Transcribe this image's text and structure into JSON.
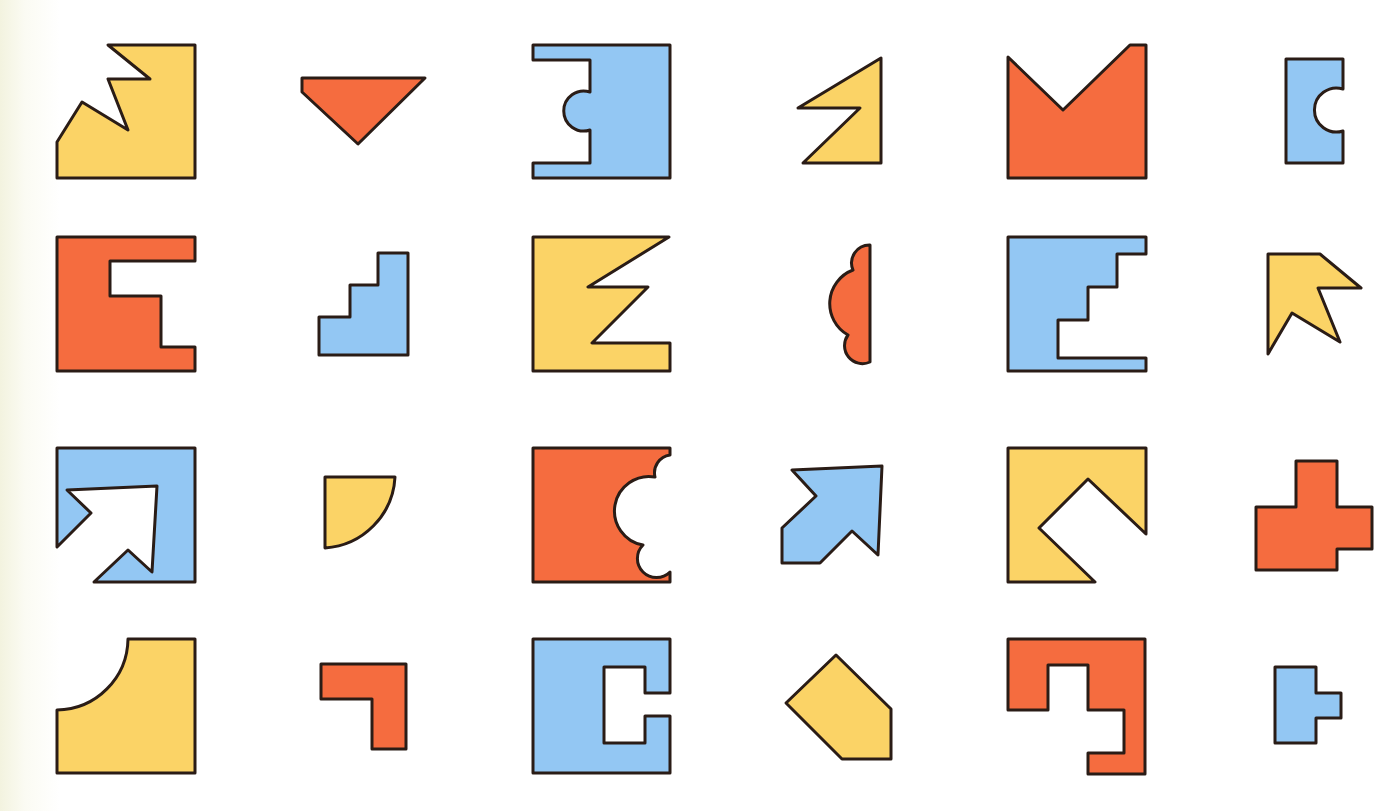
{
  "page": {
    "title": "Shape puzzle grid",
    "background": "#ffffff",
    "edge_tint": "#f3f3df"
  },
  "palette": {
    "yellow": "#fbd366",
    "orange": "#f56c3f",
    "blue": "#93c7f3",
    "outline": "#2a1c16"
  },
  "grid": {
    "rows": 4,
    "columns": 6
  },
  "shapes": [
    {
      "row": 1,
      "col": 1,
      "name": "yellow-zigzag-corner",
      "color": "yellow",
      "d": "M108,45 L195,45 L195,178 L57,178 L57,142 L82,102 L128,130 L108,79 L150,79 Z"
    },
    {
      "row": 1,
      "col": 2,
      "name": "orange-triangle",
      "color": "orange",
      "d": "M302,78 L425,78 L358,144 L302,92 Z"
    },
    {
      "row": 1,
      "col": 3,
      "name": "blue-notched-bump",
      "color": "blue",
      "d": "M533,45 L670,45 L670,178 L533,178 L533,163 L590,163 L590,130 A20,20 0 1 1 590,92 L590,60 L533,60 Z"
    },
    {
      "row": 1,
      "col": 4,
      "name": "yellow-flag",
      "color": "yellow",
      "d": "M881,58 L881,163 L803,163 L860,108 L798,108 Z"
    },
    {
      "row": 1,
      "col": 5,
      "name": "orange-v-notch",
      "color": "orange",
      "d": "M1008,57 L1063,110 L1130,45 L1146,45 L1146,178 L1008,178 Z"
    },
    {
      "row": 1,
      "col": 6,
      "name": "blue-c-cutout",
      "color": "blue",
      "d": "M1286,59 L1343,59 L1343,89 A22,22 0 1 0 1343,131 L1343,163 L1286,163 Z"
    },
    {
      "row": 2,
      "col": 1,
      "name": "orange-e-shape",
      "color": "orange",
      "d": "M57,237 L195,237 L195,261 L110,261 L110,296 L161,296 L161,347 L195,347 L195,371 L57,371 Z"
    },
    {
      "row": 2,
      "col": 2,
      "name": "blue-stairs",
      "color": "blue",
      "d": "M319,355 L319,317 L350,317 L350,285 L378,285 L378,253 L408,253 L408,355 Z"
    },
    {
      "row": 2,
      "col": 3,
      "name": "yellow-zigzag-e",
      "color": "yellow",
      "d": "M533,237 L669,237 L588,287 L648,287 L592,343 L670,343 L670,371 L533,371 Z"
    },
    {
      "row": 2,
      "col": 4,
      "name": "orange-scallop-half",
      "color": "orange",
      "d": "M870,245 L870,362 A18,18 0 0 1 848,335 A36,36 0 0 1 853,270 A18,18 0 0 1 870,245 Z"
    },
    {
      "row": 2,
      "col": 5,
      "name": "blue-stair-e",
      "color": "blue",
      "d": "M1008,237 L1146,237 L1146,254 L1117,254 L1117,287 L1088,287 L1088,320 L1058,320 L1058,358 L1146,358 L1146,371 L1008,371 Z"
    },
    {
      "row": 2,
      "col": 6,
      "name": "yellow-arrow-star",
      "color": "yellow",
      "d": "M1268,254 L1320,254 L1361,288 L1318,288 L1340,342 L1292,313 L1268,354 Z"
    },
    {
      "row": 3,
      "col": 1,
      "name": "blue-arrow-cutout",
      "color": "blue",
      "d": "M57,448 L195,448 L195,582 L94,582 L128,550 L152,572 L157,486 L67,490 L91,513 L57,547 Z"
    },
    {
      "row": 3,
      "col": 2,
      "name": "yellow-d-shape",
      "color": "yellow",
      "d": "M325,477 L395,477 A75,75 0 0 1 325,548 Z"
    },
    {
      "row": 3,
      "col": 3,
      "name": "orange-scallop-cut",
      "color": "orange",
      "d": "M533,448 L670,448 L670,455 A18,18 0 0 0 655,477 A34,34 0 0 0 643,545 A18,18 0 0 0 670,572 L670,582 L533,582 Z"
    },
    {
      "row": 3,
      "col": 4,
      "name": "blue-arrow",
      "color": "blue",
      "d": "M792,470 L882,466 L878,555 L852,531 L820,563 L782,563 L782,528 L816,496 Z"
    },
    {
      "row": 3,
      "col": 5,
      "name": "yellow-v-cut",
      "color": "yellow",
      "d": "M1008,448 L1146,448 L1146,534 L1088,479 L1039,528 L1095,582 L1008,582 Z"
    },
    {
      "row": 3,
      "col": 6,
      "name": "orange-cross",
      "color": "orange",
      "d": "M1296,461 L1337,461 L1337,507 L1372,507 L1372,549 L1337,549 L1337,570 L1256,570 L1256,507 L1296,507 Z"
    },
    {
      "row": 4,
      "col": 1,
      "name": "yellow-arc-cut",
      "color": "yellow",
      "d": "M128,639 L195,639 L195,773 L57,773 L57,710 A72,72 0 0 0 128,639 Z"
    },
    {
      "row": 4,
      "col": 2,
      "name": "orange-l-shape",
      "color": "orange",
      "d": "M321,664 L406,664 L406,749 L372,749 L372,699 L321,699 Z"
    },
    {
      "row": 4,
      "col": 3,
      "name": "blue-c-slot",
      "color": "blue",
      "d": "M533,639 L670,639 L670,693 L645,693 L645,667 L604,667 L604,743 L645,743 L645,716 L670,716 L670,773 L533,773 Z"
    },
    {
      "row": 4,
      "col": 4,
      "name": "yellow-pentagon",
      "color": "yellow",
      "d": "M836,655 L891,709 L891,759 L842,759 L786,703 Z"
    },
    {
      "row": 4,
      "col": 5,
      "name": "orange-hook",
      "color": "orange",
      "d": "M1008,639 L1145,639 L1145,774 L1088,774 L1088,753 L1124,753 L1124,710 L1088,710 L1088,665 L1048,665 L1048,710 L1008,710 Z"
    },
    {
      "row": 4,
      "col": 6,
      "name": "blue-t-shape",
      "color": "blue",
      "d": "M1275,667 L1316,667 L1316,693 L1341,693 L1341,718 L1316,718 L1316,743 L1275,743 Z"
    }
  ]
}
